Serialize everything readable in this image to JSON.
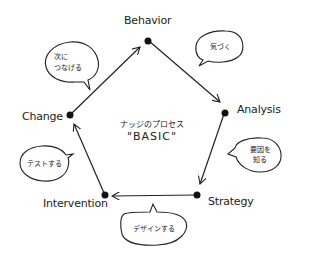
{
  "diagram": {
    "center": {
      "title": "ナッジのプロセス",
      "subtitle": "\"BASIC\""
    },
    "nodes": [
      {
        "id": "behavior",
        "label": "Behavior"
      },
      {
        "id": "analysis",
        "label": "Analysis"
      },
      {
        "id": "strategy",
        "label": "Strategy"
      },
      {
        "id": "intervention",
        "label": "Intervention"
      },
      {
        "id": "change",
        "label": "Change"
      }
    ],
    "bubbles": [
      {
        "id": "notice",
        "text": "気づく"
      },
      {
        "id": "know-cause",
        "line1": "要因を",
        "line2": "知る"
      },
      {
        "id": "design",
        "text": "デザインする"
      },
      {
        "id": "test",
        "text": "テストする"
      },
      {
        "id": "next",
        "line1": "次に",
        "line2": "つなげる"
      }
    ],
    "edges": [
      {
        "from": "behavior",
        "to": "analysis"
      },
      {
        "from": "analysis",
        "to": "strategy"
      },
      {
        "from": "strategy",
        "to": "intervention"
      },
      {
        "from": "intervention",
        "to": "change"
      },
      {
        "from": "change",
        "to": "behavior"
      }
    ],
    "colors": {
      "stroke": "#222222",
      "background": "#ffffff"
    }
  }
}
